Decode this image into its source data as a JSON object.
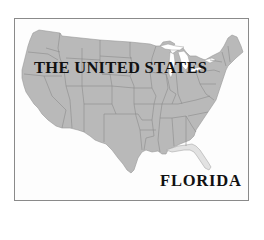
{
  "map": {
    "title": "THE UNITED STATES",
    "highlighted_region_label": "FLORIDA",
    "regions": [
      {
        "name": "contiguous-united-states",
        "fill": "#b9b9b9"
      },
      {
        "name": "florida",
        "fill": "#e2e2e2",
        "highlighted": true
      }
    ],
    "colors": {
      "frame_border": "#8a8a8a",
      "land": "#b9b9b9",
      "highlight": "#e2e2e2",
      "state_borders": "#8c8c8c",
      "text": "#111111",
      "background": "#ffffff"
    }
  }
}
